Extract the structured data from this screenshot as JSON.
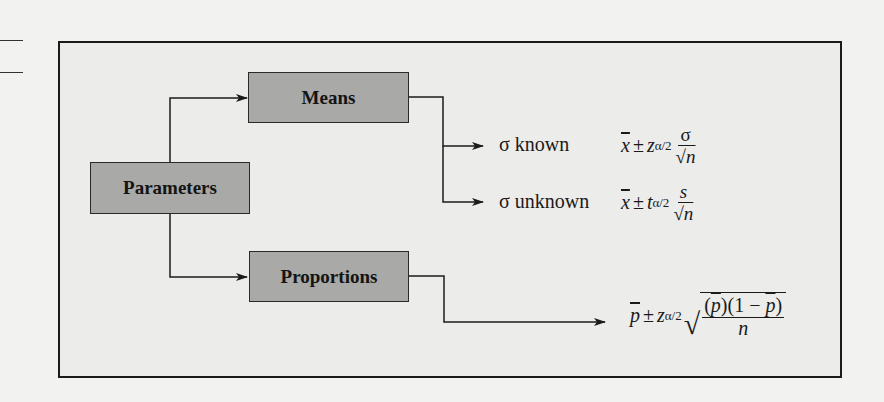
{
  "diagram": {
    "nodes": {
      "parameters": "Parameters",
      "means": "Means",
      "proportions": "Proportions"
    },
    "branches": {
      "sigma_known": "σ known",
      "sigma_unknown": "σ unknown"
    },
    "formulas": {
      "sigma_known": {
        "estimate": "x",
        "pm": "±",
        "crit": "z",
        "sub": "α/2",
        "num": "σ",
        "den_root": "√",
        "den_var": "n"
      },
      "sigma_unknown": {
        "estimate": "x",
        "pm": "±",
        "crit": "t",
        "sub": "α/2",
        "num": "s",
        "den_root": "√",
        "den_var": "n"
      },
      "proportion": {
        "estimate": "p",
        "pm": "±",
        "crit": "z",
        "sub": "α/2",
        "root": "√",
        "num_a": "(",
        "num_p1": "p",
        "num_b": ")(1 − ",
        "num_p2": "p",
        "num_c": ")",
        "den": "n"
      }
    },
    "colors": {
      "node_fill": "#a9a9a7",
      "frame_fill": "#ececea",
      "line": "#1b1b1b"
    }
  }
}
